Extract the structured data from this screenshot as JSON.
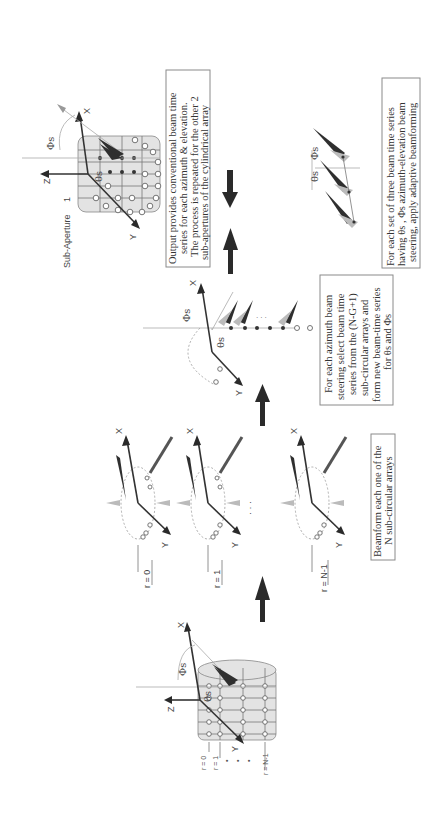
{
  "figure": {
    "orientation": "rotated 90 degrees counter-clockwise",
    "stages": [
      {
        "id": "cylindrical-array",
        "axis_labels": {
          "x": "X",
          "y": "Y",
          "z": "Z"
        },
        "angle_labels": {
          "phi": "Φs",
          "theta": "θs"
        },
        "ring_labels": {
          "first": "r = 0",
          "second": "r = 1",
          "last": "r = N-1"
        }
      },
      {
        "id": "sub-circular-arrays",
        "rings": [
          {
            "label": "r = 0"
          },
          {
            "label": "r = 1"
          },
          {
            "label": "r = N-1"
          }
        ],
        "ellipsis": "· · ·",
        "axis_labels": {
          "x": "X",
          "y": "Y"
        },
        "caption": {
          "line1": "Beamform each one of the",
          "line2": "N sub-circular arrays"
        }
      },
      {
        "id": "azimuth-beam-selection",
        "axis_labels": {
          "x": "X",
          "y": "Y"
        },
        "angle_labels": {
          "phi": "Φs",
          "theta": "θs"
        },
        "caption": {
          "line1": "For each azimuth beam",
          "line2": "steering select beam time",
          "line3": "series from the (N-G+1)",
          "line4": "sub-circular arrays and",
          "line5": "form new beam-time series",
          "line6": "for θs and Φs"
        }
      },
      {
        "id": "sub-aperture-output",
        "title": "Sub-Aperture",
        "number": "1",
        "axis_labels": {
          "x": "X",
          "y": "Y",
          "z": "Z"
        },
        "angle_labels": {
          "phi": "Φs",
          "theta": "θs"
        },
        "caption": {
          "line1": "Output provides conventional beam time",
          "line2": "series for each azimuth & elevation.",
          "line3": "The process is repeated for the other 2",
          "line4": "sub-apertures of the cylindrical array"
        }
      },
      {
        "id": "adaptive-beamforming",
        "angle_labels": {
          "phi": "Φs",
          "theta": "θs"
        },
        "caption": {
          "line1": "For each set of three beam time series",
          "line2": "having θs , Φs azimuth-elevation beam",
          "line3": "steering, apply adaptive beamforming"
        }
      }
    ],
    "colors": {
      "arrow": "#2a2a2a",
      "lobe_dark": "#2f2f2f",
      "lobe_light": "#bbbbbb",
      "cylinder_fill": "#e3e3e3",
      "box_border": "#8a8a8a"
    }
  }
}
